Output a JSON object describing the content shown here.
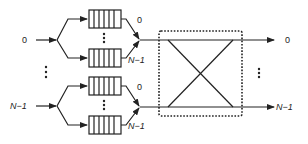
{
  "diagram": {
    "title": "",
    "inputs": [
      {
        "label": "0",
        "voq_labels": [
          "0",
          "N−1"
        ]
      },
      {
        "label": "N−1",
        "voq_labels": [
          "0",
          "N−1"
        ]
      }
    ],
    "input_ellipsis": "⋮",
    "queue_ellipsis": "⋮",
    "switch_fabric": {
      "type": "crossbar",
      "border": "dotted"
    },
    "outputs": [
      {
        "label": "0"
      },
      {
        "label": "N−1"
      }
    ],
    "output_ellipsis": "⋮",
    "colors": {
      "stroke": "#222222",
      "background": "#ffffff"
    }
  }
}
